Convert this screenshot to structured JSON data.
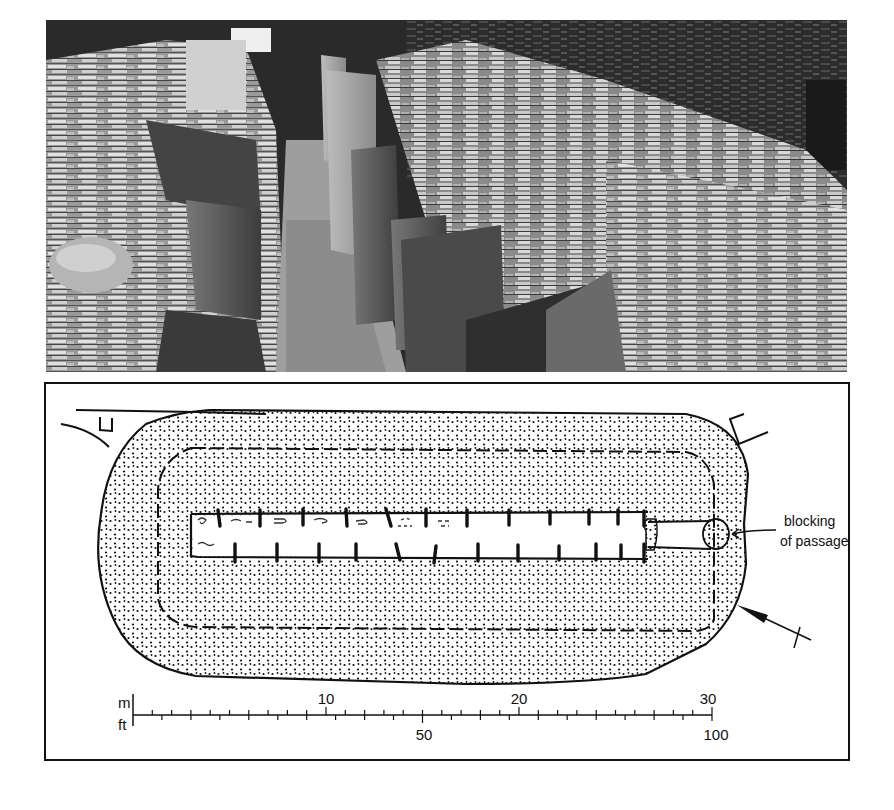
{
  "figure": {
    "photo": {
      "description": "Black-and-white photograph of a stalled chambered cairn: central passage lined with upright paired slabs dividing stalls, flanked by drystone walling"
    },
    "plan": {
      "annotation": {
        "line1": "blocking",
        "line2": "of passage"
      },
      "scale_bar": {
        "metric_unit": "m",
        "imperial_unit": "ft",
        "metric_labels": [
          "10",
          "20",
          "30"
        ],
        "imperial_labels": [
          "50",
          "100"
        ],
        "metric_max": 30,
        "imperial_max": 100
      },
      "north_arrow": true,
      "stall_divider_pairs": 12
    }
  }
}
